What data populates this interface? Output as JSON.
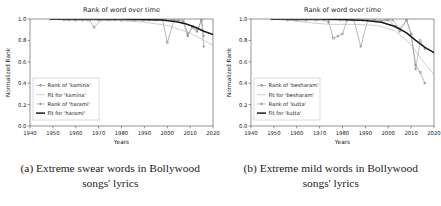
{
  "figure": {
    "subfigures": [
      {
        "id": "a",
        "caption_line1": "(a) Extreme swear words in Bollywood",
        "caption_line2": "songs' lyrics"
      },
      {
        "id": "b",
        "caption_line1": "(b) Extreme mild words in Bollywood",
        "caption_line2": "songs' lyrics"
      }
    ]
  },
  "chart_data": [
    {
      "type": "line",
      "title": "Rank of word over time",
      "xlabel": "Years",
      "ylabel": "Normalized Rank",
      "xlim": [
        1940,
        2020
      ],
      "ylim": [
        0.0,
        1.0
      ],
      "xticks": [
        1940,
        1950,
        1960,
        1970,
        1980,
        1990,
        2000,
        2010,
        2020
      ],
      "yticks": [
        "0.0",
        "0.2",
        "0.4",
        "0.6",
        "0.8",
        "1.0"
      ],
      "grid": false,
      "legend_position": "lower left",
      "legend": [
        "Rank of 'kamina'",
        "Fit for 'kamina'",
        "Rank of 'harami'",
        "Fit for 'harami'"
      ],
      "series": [
        {
          "name": "Rank of 'kamina'",
          "style": "marker-line",
          "color": "#8a8a8a",
          "x": [
            1949,
            1953,
            1957,
            1960,
            1963,
            1966,
            1968,
            1971,
            1974,
            1977,
            1980,
            1983,
            1986,
            1989,
            1992,
            1995,
            1998,
            2000,
            2003,
            2005,
            2007,
            2009,
            2011,
            2013,
            2015,
            2016
          ],
          "y": [
            1.0,
            1.0,
            0.99,
            0.99,
            0.99,
            0.99,
            0.92,
            0.99,
            0.99,
            0.99,
            0.99,
            0.99,
            0.99,
            0.99,
            0.99,
            0.99,
            0.99,
            0.78,
            0.99,
            0.99,
            0.97,
            0.84,
            0.93,
            0.89,
            0.99,
            0.74
          ]
        },
        {
          "name": "Fit for 'kamina'",
          "style": "thin-line",
          "color": "#a6a6a6",
          "x": [
            1949,
            1960,
            1970,
            1980,
            1990,
            2000,
            2010,
            2016,
            2020
          ],
          "y": [
            1.0,
            0.995,
            0.99,
            0.985,
            0.97,
            0.94,
            0.87,
            0.8,
            0.755
          ]
        },
        {
          "name": "Rank of 'harami'",
          "style": "marker-line",
          "color": "#9a9a9a",
          "x": [
            1949,
            1955,
            1960,
            1965,
            1970,
            1975,
            1980,
            1985,
            1990,
            1995,
            1999,
            2002,
            2005,
            2007,
            2009,
            2011,
            2013,
            2015,
            2016
          ],
          "y": [
            1.0,
            0.99,
            0.99,
            0.99,
            0.99,
            0.99,
            0.99,
            0.99,
            0.99,
            0.99,
            0.99,
            0.99,
            0.99,
            0.99,
            0.86,
            0.92,
            0.88,
            0.99,
            0.84
          ]
        },
        {
          "name": "Fit for 'harami'",
          "style": "thick-line",
          "color": "#1a1a1a",
          "x": [
            1949,
            1960,
            1970,
            1980,
            1990,
            1998,
            2004,
            2008,
            2012,
            2016,
            2020
          ],
          "y": [
            1.0,
            1.0,
            1.0,
            1.0,
            0.995,
            0.99,
            0.975,
            0.955,
            0.925,
            0.885,
            0.855
          ]
        }
      ]
    },
    {
      "type": "line",
      "title": "Rank of word over time",
      "xlabel": "Years",
      "ylabel": "Normalized Rank",
      "xlim": [
        1940,
        2020
      ],
      "ylim": [
        0.0,
        1.0
      ],
      "xticks": [
        1940,
        1950,
        1960,
        1970,
        1980,
        1990,
        2000,
        2010,
        2020
      ],
      "yticks": [
        "0.0",
        "0.2",
        "0.4",
        "0.6",
        "0.8",
        "1.0"
      ],
      "grid": false,
      "legend_position": "lower left",
      "legend": [
        "Rank of 'besharam'",
        "Fit for 'besharam'",
        "Rank of 'kutta'",
        "Fit for 'kutta'"
      ],
      "series": [
        {
          "name": "Rank of 'besharam'",
          "style": "marker-line",
          "color": "#8a8a8a",
          "x": [
            1949,
            1952,
            1956,
            1960,
            1964,
            1968,
            1972,
            1974,
            1976,
            1978,
            1980,
            1982,
            1985,
            1988,
            1991,
            1994,
            1997,
            2000,
            2003,
            2005,
            2008,
            2010,
            2012,
            2014,
            2016
          ],
          "y": [
            1.0,
            1.0,
            0.99,
            0.99,
            0.99,
            0.99,
            0.99,
            0.97,
            0.82,
            0.84,
            0.86,
            0.99,
            0.99,
            0.74,
            0.99,
            0.99,
            0.98,
            0.99,
            0.93,
            0.88,
            0.99,
            0.86,
            0.57,
            0.5,
            0.4
          ]
        },
        {
          "name": "Fit for 'besharam'",
          "style": "thin-line",
          "color": "#a6a6a6",
          "x": [
            1949,
            1958,
            1968,
            1975,
            1985,
            1995,
            2003,
            2010,
            2016,
            2020
          ],
          "y": [
            1.0,
            0.985,
            0.96,
            0.95,
            0.95,
            0.94,
            0.89,
            0.76,
            0.58,
            0.48
          ]
        },
        {
          "name": "Rank of 'kutta'",
          "style": "marker-line",
          "color": "#9a9a9a",
          "x": [
            1949,
            1954,
            1959,
            1964,
            1969,
            1974,
            1979,
            1984,
            1989,
            1994,
            1999,
            2002,
            2005,
            2008,
            2010,
            2012,
            2014,
            2016
          ],
          "y": [
            1.0,
            1.0,
            0.99,
            0.99,
            0.99,
            0.99,
            0.99,
            0.99,
            0.99,
            0.99,
            0.99,
            0.99,
            0.91,
            0.99,
            0.86,
            0.53,
            0.8,
            0.72
          ]
        },
        {
          "name": "Fit for 'kutta'",
          "style": "thick-line",
          "color": "#1a1a1a",
          "x": [
            1949,
            1960,
            1970,
            1980,
            1990,
            1997,
            2003,
            2008,
            2012,
            2016,
            2020
          ],
          "y": [
            1.0,
            1.0,
            1.0,
            0.995,
            0.985,
            0.97,
            0.93,
            0.87,
            0.8,
            0.735,
            0.685
          ]
        }
      ]
    }
  ]
}
